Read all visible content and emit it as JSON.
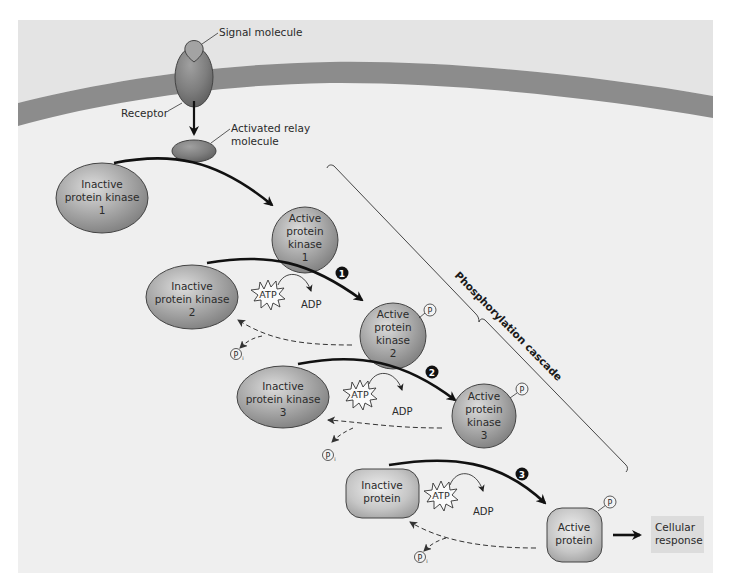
{
  "title": "Phosphorylation cascade",
  "colors": {
    "background": "#efefef",
    "extracellular": "#e6e6e6",
    "membrane": "#8c8c8c",
    "protein_fill": "#9a9a9a",
    "protein_light": "#d8d8d8",
    "response_box": "#dcdcdc",
    "arrow": "#111111"
  },
  "labels": {
    "signal_molecule": "Signal molecule",
    "receptor": "Receptor",
    "relay_line1": "Activated relay",
    "relay_line2": "molecule",
    "cascade": "Phosphorylation cascade",
    "cellular_line1": "Cellular",
    "cellular_line2": "response"
  },
  "molecules": {
    "inactive_k1": [
      "Inactive",
      "protein kinase",
      "1"
    ],
    "active_k1": [
      "Active",
      "protein",
      "kinase",
      "1"
    ],
    "inactive_k2": [
      "Inactive",
      "protein kinase",
      "2"
    ],
    "active_k2": [
      "Active",
      "protein",
      "kinase",
      "2"
    ],
    "inactive_k3": [
      "Inactive",
      "protein kinase",
      "3"
    ],
    "active_k3": [
      "Active",
      "protein",
      "kinase",
      "3"
    ],
    "inactive_protein": [
      "Inactive",
      "protein"
    ],
    "active_protein": [
      "Active",
      "protein"
    ]
  },
  "steps": [
    "1",
    "2",
    "3"
  ],
  "atp": "ATP",
  "adp": "ADP",
  "phosphate": "P",
  "phosphate_sub": "i"
}
